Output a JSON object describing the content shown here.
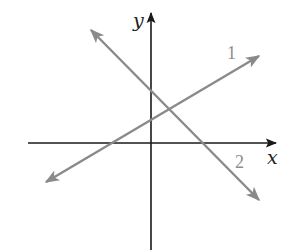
{
  "diagram": {
    "type": "coordinate-plane-two-lines",
    "axes": {
      "x_label": "x",
      "y_label": "y",
      "color": "#1a1a1a"
    },
    "lines": [
      {
        "label": "1",
        "slope_sign": "positive",
        "color": "#8a8a8a"
      },
      {
        "label": "2",
        "slope_sign": "negative",
        "color": "#8a8a8a"
      }
    ]
  }
}
